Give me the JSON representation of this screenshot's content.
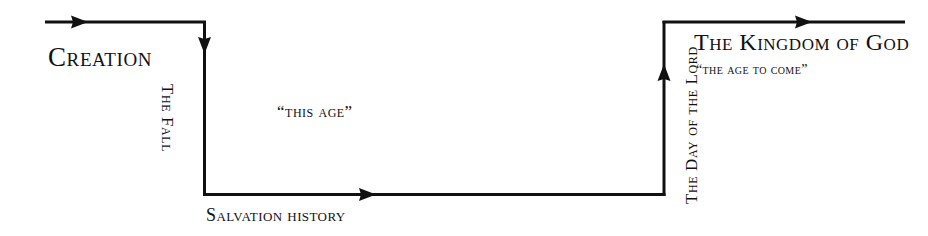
{
  "diagram": {
    "background_color": "#ffffff",
    "line_color": "#111111",
    "line_width": 3,
    "width": 928,
    "height": 236,
    "labels": {
      "creation": "Creation",
      "the_fall": "The Fall",
      "this_age": "“this age”",
      "salvation_history": "Salvation history",
      "day_of_the_lord": "The Day of the Lord",
      "kingdom_of_god": "The Kingdom of God",
      "age_to_come": "“the age to come”"
    },
    "segments": [
      {
        "name": "creation-segment",
        "orientation": "horizontal",
        "from": [
          45,
          22
        ],
        "to": [
          203,
          22
        ],
        "arrowhead": "right",
        "arrow_tip_x": 88
      },
      {
        "name": "fall-segment",
        "orientation": "vertical",
        "from": [
          203,
          22
        ],
        "to": [
          203,
          196
        ],
        "arrowhead": "down",
        "arrow_tip_y": 52
      },
      {
        "name": "salvation-history-segment",
        "orientation": "horizontal",
        "from": [
          203,
          196
        ],
        "to": [
          664,
          196
        ],
        "arrowhead": "right",
        "arrow_tip_x": 375
      },
      {
        "name": "day-of-the-lord-segment",
        "orientation": "vertical",
        "from": [
          664,
          196
        ],
        "to": [
          664,
          22
        ],
        "arrowhead": "up",
        "arrow_tip_y": 68
      },
      {
        "name": "kingdom-of-god-segment",
        "orientation": "horizontal",
        "from": [
          664,
          22
        ],
        "to": [
          905,
          22
        ],
        "arrowhead": "right",
        "arrow_tip_x": 812
      }
    ]
  }
}
